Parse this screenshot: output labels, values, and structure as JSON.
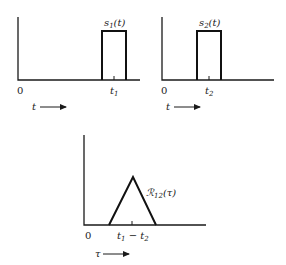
{
  "diagram": {
    "panels": [
      {
        "id": "s1",
        "signal_label": "s",
        "signal_sub": "1",
        "signal_arg": "(t)",
        "origin_label": "0",
        "tick_label": "t",
        "tick_sub": "1",
        "axis_var": "t",
        "shape": "rectangular-pulse"
      },
      {
        "id": "s2",
        "signal_label": "s",
        "signal_sub": "2",
        "signal_arg": "(t)",
        "origin_label": "0",
        "tick_label": "t",
        "tick_sub": "2",
        "axis_var": "t",
        "shape": "rectangular-pulse"
      },
      {
        "id": "R12",
        "signal_label": "ℛ",
        "signal_sub": "12",
        "signal_arg": "(τ)",
        "origin_label": "0",
        "tick_label_a": "t",
        "tick_sub_a": "1",
        "tick_minus": " − ",
        "tick_label_b": "t",
        "tick_sub_b": "2",
        "axis_var": "τ",
        "shape": "triangle"
      }
    ],
    "colors": {
      "stroke": "#111111",
      "background": "#ffffff"
    }
  }
}
